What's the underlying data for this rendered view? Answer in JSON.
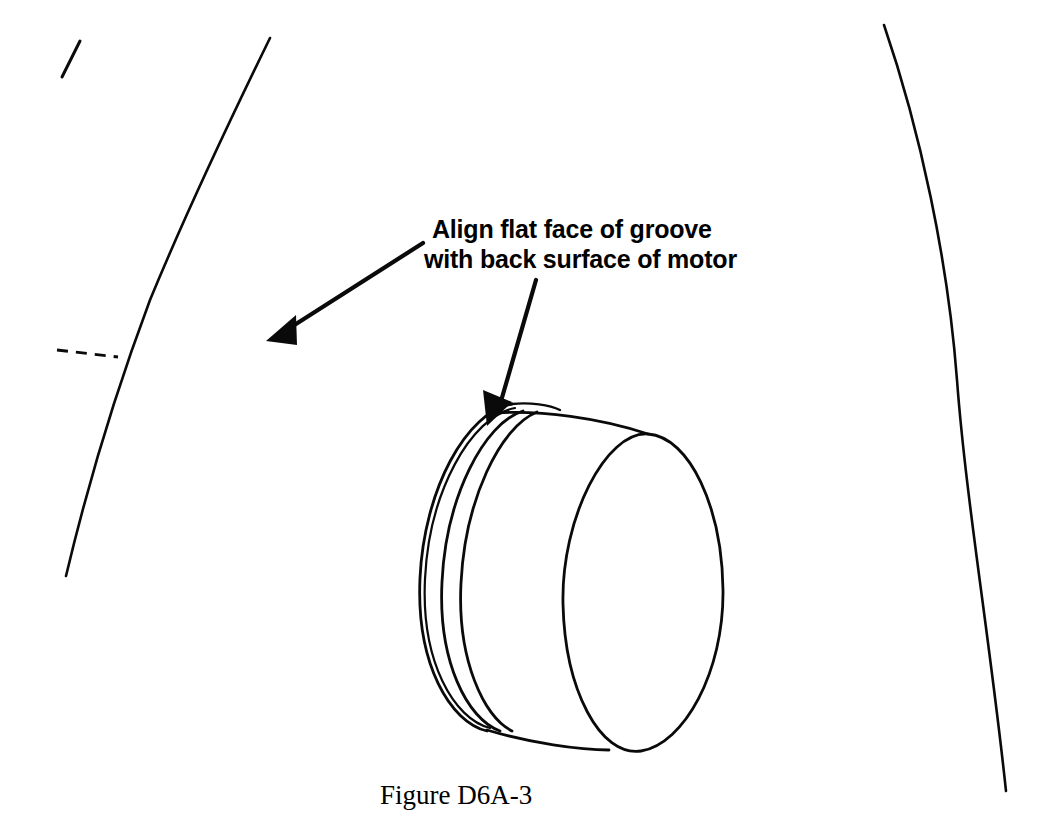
{
  "figure": {
    "caption": "Figure D6A-3",
    "annotation": {
      "line1": "Align flat face of groove",
      "line2": "with back surface of motor",
      "full_text": "Align flat face of groove with back surface of motor"
    },
    "colors": {
      "background": "#ffffff",
      "line": "#000000",
      "text": "#000000"
    },
    "drawing_type": "technical-line-drawing",
    "parts": [
      {
        "name": "motor-body-left-outline",
        "description": "long curved line, left side of motor housing"
      },
      {
        "name": "motor-body-right-outline",
        "description": "long curved line, right side of motor housing"
      },
      {
        "name": "motor-centerline-dash",
        "description": "short dashed horizontal reference line"
      },
      {
        "name": "motor-tick-mark",
        "description": "short diagonal tick at upper left"
      },
      {
        "name": "collar-cylinder",
        "description": "isometric cylindrical collar with circumferential groove"
      },
      {
        "name": "groove-arcs",
        "description": "concentric arcs forming the flat-faced groove"
      }
    ],
    "arrows": [
      {
        "name": "arrow-to-motor-back-surface",
        "direction": "down-left",
        "from": [
          423,
          243
        ],
        "to": [
          268,
          340
        ]
      },
      {
        "name": "arrow-to-groove-flat-face",
        "direction": "down-left",
        "from": [
          536,
          280
        ],
        "to": [
          489,
          424
        ]
      }
    ]
  }
}
